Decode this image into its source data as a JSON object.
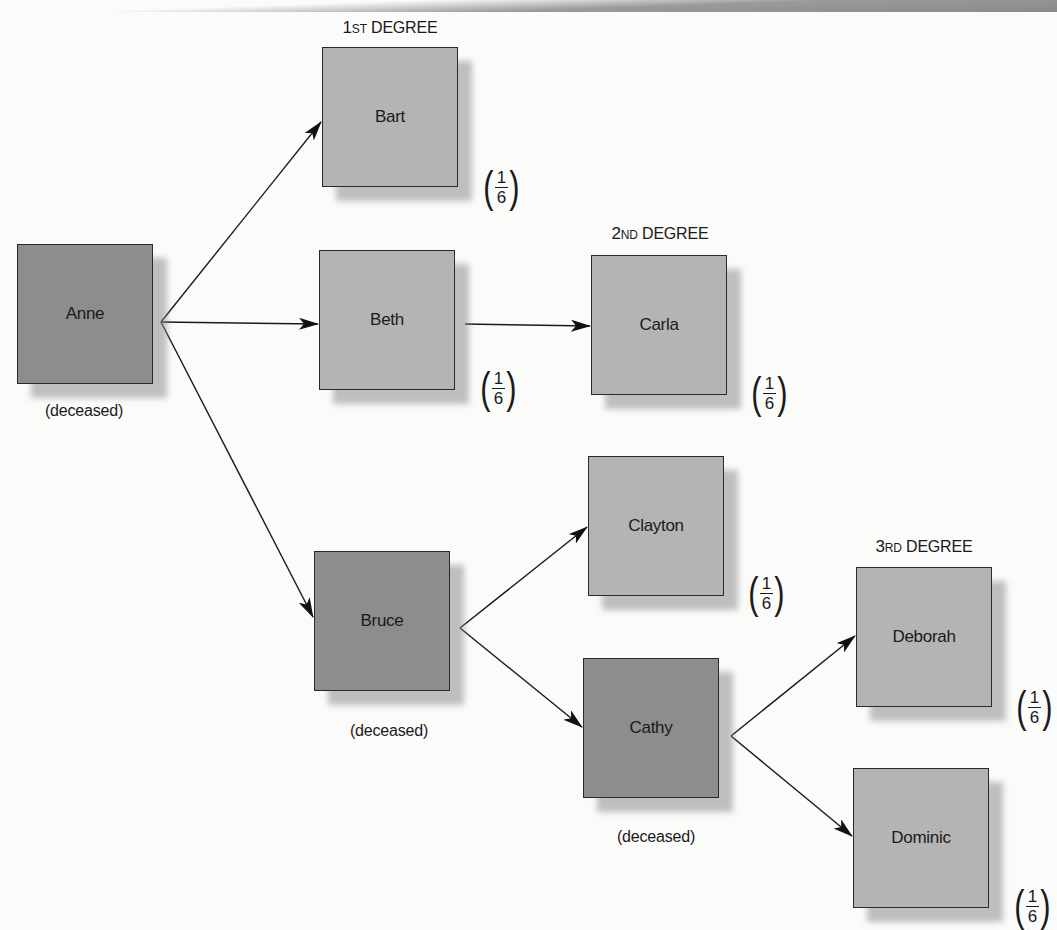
{
  "diagram": {
    "type": "inheritance-degree-tree",
    "degrees": [
      {
        "id": "d1",
        "number": "1",
        "suffix": "ST",
        "label": "DEGREE"
      },
      {
        "id": "d2",
        "number": "2",
        "suffix": "ND",
        "label": "DEGREE"
      },
      {
        "id": "d3",
        "number": "3",
        "suffix": "RD",
        "label": "DEGREE"
      }
    ],
    "nodes": [
      {
        "id": "anne",
        "name": "Anne",
        "status": "(deceased)",
        "share": null
      },
      {
        "id": "bart",
        "name": "Bart",
        "status": null,
        "share": {
          "numerator": "1",
          "denominator": "6"
        }
      },
      {
        "id": "beth",
        "name": "Beth",
        "status": null,
        "share": {
          "numerator": "1",
          "denominator": "6"
        }
      },
      {
        "id": "bruce",
        "name": "Bruce",
        "status": "(deceased)",
        "share": null
      },
      {
        "id": "carla",
        "name": "Carla",
        "status": null,
        "share": {
          "numerator": "1",
          "denominator": "6"
        }
      },
      {
        "id": "clayton",
        "name": "Clayton",
        "status": null,
        "share": {
          "numerator": "1",
          "denominator": "6"
        }
      },
      {
        "id": "cathy",
        "name": "Cathy",
        "status": "(deceased)",
        "share": null
      },
      {
        "id": "deborah",
        "name": "Deborah",
        "status": null,
        "share": {
          "numerator": "1",
          "denominator": "6"
        }
      },
      {
        "id": "dominic",
        "name": "Dominic",
        "status": null,
        "share": {
          "numerator": "1",
          "denominator": "6"
        }
      }
    ],
    "edges": [
      {
        "from": "Anne",
        "to": "Bart"
      },
      {
        "from": "Anne",
        "to": "Beth"
      },
      {
        "from": "Anne",
        "to": "Bruce"
      },
      {
        "from": "Beth",
        "to": "Carla"
      },
      {
        "from": "Bruce",
        "to": "Clayton"
      },
      {
        "from": "Bruce",
        "to": "Cathy"
      },
      {
        "from": "Cathy",
        "to": "Deborah"
      },
      {
        "from": "Cathy",
        "to": "Dominic"
      }
    ],
    "colors": {
      "living_box": "#b4b4b4",
      "deceased_box": "#8d8d8d",
      "border": "#2a2a2a",
      "shadow": "#a0a0a0",
      "background": "#fbfbfa"
    }
  }
}
